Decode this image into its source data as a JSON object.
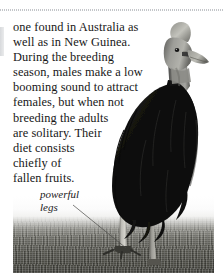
{
  "page": {
    "background_color": "#ffffff",
    "width": 224,
    "height": 273
  },
  "rules": {
    "top_dotted_rule": "dotted-horizontal-rule",
    "rule_color": "#b9bcc0"
  },
  "body_text": {
    "full_text": "one found in Australia as well as in New Guinea. During the breeding season, males make a low booming sound to attract females, but when not breeding the adults are solitary. Their diet consists chiefly of fallen fruits.",
    "lines": [
      "one found in Australia as",
      "well as in New Guinea.",
      "During the breeding",
      "season, males make a low",
      "booming sound to attract",
      "females, but when not",
      "breeding the adults",
      "are solitary. Their",
      "diet consists",
      "chiefly of",
      "fallen fruits."
    ]
  },
  "caption": {
    "lines": [
      "powerful",
      "legs"
    ],
    "full_text": "powerful legs",
    "style": "italic",
    "leader_line": "leader-line-to-leg"
  },
  "photo": {
    "subject": "cassowary",
    "description": "Southern cassowary standing in grass field",
    "colors": {
      "body": "#0d0d0d",
      "casque": "#6d6d6d",
      "neck": "#8d8d8d",
      "beak": "#7a7a7a",
      "leg": "#b5b4ae",
      "grass_near": "#4a4a44",
      "grass_far": "#a0a099",
      "sky": "#fbfbfb"
    }
  }
}
